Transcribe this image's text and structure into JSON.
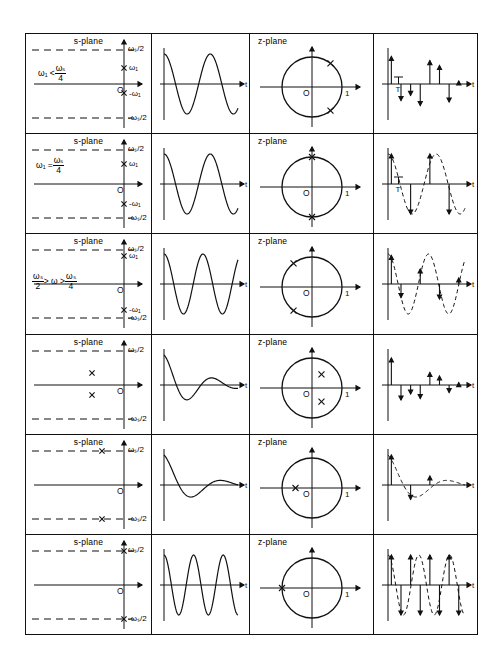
{
  "figure": {
    "type": "signal-processing-pole-mapping-table",
    "columns": [
      "s-plane",
      "continuous-time waveform",
      "z-plane",
      "sampled sequence"
    ],
    "row_count": 6,
    "labels": {
      "s_plane": "s-plane",
      "z_plane": "z-plane",
      "origin": "O",
      "unit_real": "1",
      "time_axis": "t",
      "pole_marker": "X",
      "sample_period": "T",
      "omega_half_pos": "ωₛ/2",
      "omega_half_neg": "-ωₛ/2",
      "omega1_pos": "ω₁",
      "omega1_neg": "-ω₁"
    },
    "rows": [
      {
        "index": 1,
        "condition": "ω₁ < ωₛ/4",
        "condition_parts": {
          "lhs": "ω₁",
          "rel": "<",
          "num": "ωₛ",
          "den": "4"
        },
        "s_plane": {
          "poles": [
            {
              "sigma": 0,
              "omega": "+ω₁"
            },
            {
              "sigma": 0,
              "omega": "-ω₁"
            }
          ],
          "pole_location": "imaginary axis, inside ±ωₛ/2 strip",
          "labels": [
            "ωₛ/2",
            "ω₁",
            "O",
            "-ω₁",
            "-ωₛ/2"
          ]
        },
        "waveform": {
          "shape": "undamped sinusoid",
          "cycles": 1.6,
          "damping": 0
        },
        "z_plane": {
          "poles_deg": [
            52,
            -52
          ],
          "radius": 1.0,
          "description": "conjugate pair on unit circle, first/fourth quadrant"
        },
        "samples": {
          "description": "impulse train, no dashed envelope",
          "show_envelope": false,
          "show_T": true,
          "values": [
            0.92,
            -0.55,
            -0.38,
            -0.72,
            0.78,
            0.62,
            -0.6,
            0.1
          ]
        }
      },
      {
        "index": 2,
        "condition": "ω₁ = ωₛ/4",
        "condition_parts": {
          "lhs": "ω₁",
          "rel": "=",
          "num": "ωₛ",
          "den": "4"
        },
        "s_plane": {
          "poles": [
            {
              "sigma": 0,
              "omega": "+ω₁"
            },
            {
              "sigma": 0,
              "omega": "-ω₁"
            }
          ],
          "pole_location": "imaginary axis at half of ωₛ/2",
          "labels": [
            "ωₛ/2",
            "ω₁",
            "O",
            "-ω₁",
            "-ωₛ/2"
          ]
        },
        "waveform": {
          "shape": "undamped sinusoid",
          "cycles": 1.6,
          "damping": 0
        },
        "z_plane": {
          "poles_deg": [
            90,
            -90
          ],
          "radius": 1.0,
          "description": "conjugate pair at ±j on unit circle"
        },
        "samples": {
          "description": "impulses with dashed sinusoid envelope",
          "show_envelope": true,
          "show_T": true,
          "values": [
            1.0,
            0,
            -1.0,
            0,
            1.0,
            0,
            -1.0,
            0
          ]
        }
      },
      {
        "index": 3,
        "condition": "ωₛ/2 > ω > ωₛ/4",
        "condition_parts": {
          "lnum": "ωₛ",
          "lden": "2",
          "rel1": ">",
          "mid": "ω",
          "rel2": ">",
          "rnum": "ωₛ",
          "rden": "4"
        },
        "s_plane": {
          "poles": [
            {
              "sigma": 0,
              "omega": "+ω₁"
            },
            {
              "sigma": 0,
              "omega": "-ω₁"
            }
          ],
          "pole_location": "imaginary axis near ±ωₛ/2",
          "labels": [
            "ωₛ/2",
            "ω₁",
            "O",
            "-ω₁"
          ]
        },
        "waveform": {
          "shape": "undamped sinusoid",
          "cycles": 1.9,
          "damping": 0
        },
        "z_plane": {
          "poles_deg": [
            128,
            -128
          ],
          "radius": 1.0,
          "description": "conjugate pair on unit circle, second/third quadrant"
        },
        "samples": {
          "description": "impulses with aliased dashed envelope",
          "show_envelope": true,
          "show_T": false,
          "values": [
            0.95,
            -0.45,
            0,
            0.5,
            0,
            -0.5,
            0,
            0.2
          ]
        }
      },
      {
        "index": 4,
        "condition": "",
        "s_plane": {
          "poles": [
            {
              "sigma": "-a",
              "omega": "+"
            },
            {
              "sigma": "-a",
              "omega": "-"
            }
          ],
          "pole_location": "left half-plane, complex pair",
          "labels": [
            "ωₛ/2",
            "O"
          ]
        },
        "waveform": {
          "shape": "damped sinusoid",
          "cycles": 1.5,
          "damping": 0.55
        },
        "z_plane": {
          "poles_deg": [
            55,
            -55
          ],
          "radius": 0.55,
          "description": "conjugate pair inside unit circle"
        },
        "samples": {
          "description": "decaying impulse train, no envelope",
          "show_envelope": false,
          "show_T": false,
          "values": [
            0.9,
            -0.5,
            -0.3,
            -0.45,
            0.42,
            0.3,
            -0.25,
            0.08
          ]
        }
      },
      {
        "index": 5,
        "condition": "",
        "s_plane": {
          "poles": [
            {
              "sigma": "-a",
              "omega": "+ωₛ/2"
            },
            {
              "sigma": "-a",
              "omega": "-ωₛ/2"
            }
          ],
          "pole_location": "left half-plane on the ±ωₛ/2 dashed lines",
          "labels": [
            "ωₛ/2",
            "O"
          ]
        },
        "waveform": {
          "shape": "damped sinusoid",
          "cycles": 1.25,
          "damping": 0.6
        },
        "z_plane": {
          "poles_deg": [
            180
          ],
          "radius": 0.55,
          "description": "single pole on negative real axis inside unit circle"
        },
        "samples": {
          "description": "alternating decaying impulses with dashed envelope",
          "show_envelope": true,
          "show_T": false,
          "values": [
            1.0,
            0,
            -0.48,
            0,
            0.3,
            0,
            0,
            0
          ]
        }
      },
      {
        "index": 6,
        "condition": "",
        "s_plane": {
          "poles": [
            {
              "sigma": 0,
              "omega": "+ωₛ/2"
            },
            {
              "sigma": 0,
              "omega": "-ωₛ/2"
            }
          ],
          "pole_location": "imaginary axis exactly at ±ωₛ/2",
          "labels": [
            "ωₛ/2",
            "O"
          ]
        },
        "waveform": {
          "shape": "undamped sinusoid",
          "cycles": 2.5,
          "damping": 0
        },
        "z_plane": {
          "poles_deg": [
            180
          ],
          "radius": 1.0,
          "description": "pole at z = -1 on unit circle"
        },
        "samples": {
          "description": "full-amplitude alternating impulses with dashed envelope",
          "show_envelope": true,
          "show_T": false,
          "values": [
            1.0,
            -1.0,
            1.0,
            -1.0,
            1.0,
            -1.0,
            1.0,
            -1.0
          ]
        }
      }
    ]
  }
}
